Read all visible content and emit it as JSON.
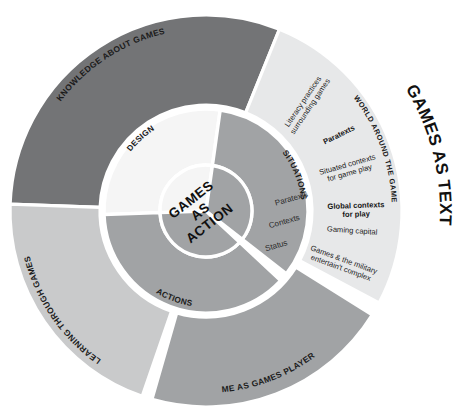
{
  "figure": {
    "title_center": [
      "GAMES",
      "AS",
      "ACTION"
    ],
    "edge_title": "GAMES AS TEXT",
    "arc_caption": "WORLD AROUND THE GAME"
  },
  "colors": {
    "dark_gray": "#737476",
    "mid_gray": "#a1a3a5",
    "light_gray": "#c9cacb",
    "pale_gray": "#e7e8e9",
    "near_white": "#f5f5f5",
    "white": "#ffffff",
    "text": "#1b1b1b"
  },
  "chart_data": {
    "type": "pie",
    "center_radius": 46,
    "inner_ring": {
      "radius_inner": 46,
      "radius_outer": 102,
      "segments": [
        {
          "label": "DESIGN",
          "start_deg": 268,
          "end_deg": 8,
          "color": "#f5f5f5"
        },
        {
          "label": "SITUATIONS",
          "start_deg": 8,
          "end_deg": 128,
          "color": "#a1a3a5"
        },
        {
          "label": "ACTIONS",
          "start_deg": 133,
          "end_deg": 268,
          "color": "#a1a3a5"
        }
      ]
    },
    "outer_ring": {
      "radius_inner": 106,
      "radius_outer": 196,
      "segments": [
        {
          "label": "KNOWLEDGE ABOUT GAMES",
          "start_deg": 272,
          "end_deg": 22,
          "color": "#737476"
        },
        {
          "label": "WORLD AROUND THE GAME",
          "start_deg": 22,
          "end_deg": 118,
          "color": "#e7e8e9"
        },
        {
          "label": "ME AS GAMES PLAYER",
          "start_deg": 122,
          "end_deg": 196,
          "color": "#a1a3a5"
        },
        {
          "label": "LEARNING THROUGH GAMES",
          "start_deg": 199,
          "end_deg": 272,
          "color": "#c9cacb"
        }
      ]
    },
    "center_labels": [
      {
        "text": "Paratexts"
      },
      {
        "text": "Contexts"
      },
      {
        "text": "Status"
      }
    ],
    "detail_labels": [
      {
        "text": "Literacy practices surrounding games",
        "lines": [
          "Literacy practices",
          "surrounding games"
        ],
        "weight": "regular"
      },
      {
        "text": "Paratexts",
        "lines": [
          "Paratexts"
        ],
        "weight": "bold"
      },
      {
        "text": "Situated contexts for game play",
        "lines": [
          "Situated contexts",
          "for game play"
        ],
        "weight": "regular"
      },
      {
        "text": "Global contexts for play",
        "lines": [
          "Global contexts",
          "for play"
        ],
        "weight": "bold"
      },
      {
        "text": "Gaming capital",
        "lines": [
          "Gaming capital"
        ],
        "weight": "regular"
      },
      {
        "text": "Games & the military entertain't complex",
        "lines": [
          "Games & the military",
          "entertain't complex"
        ],
        "weight": "regular"
      }
    ]
  }
}
